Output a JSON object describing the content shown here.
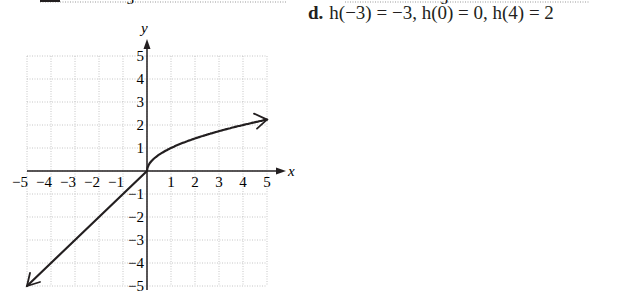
{
  "problem": {
    "letter": "d.",
    "answer_text": "h(−3) = −3, h(0) = 0, h(4) = 2"
  },
  "top_fragment": {
    "left_label": "−5",
    "right_label": "−5"
  },
  "chart_data": {
    "type": "line",
    "title": "",
    "xlabel": "x",
    "ylabel": "y",
    "xlim": [
      -5,
      5
    ],
    "ylim": [
      -5,
      5
    ],
    "grid": true,
    "x_ticks": [
      -5,
      -4,
      -3,
      -2,
      -1,
      1,
      2,
      3,
      4,
      5
    ],
    "y_ticks": [
      -5,
      -4,
      -3,
      -2,
      -1,
      1,
      2,
      3,
      4,
      5
    ],
    "x_tick_labels": [
      "−5",
      "−4",
      "−3",
      "−2",
      "−1",
      "1",
      "2",
      "3",
      "4",
      "5"
    ],
    "y_tick_labels": [
      "−5",
      "−4",
      "−3",
      "−2",
      "−1",
      "1",
      "2",
      "3",
      "4",
      "5"
    ],
    "series": [
      {
        "name": "h(x)",
        "description": "piecewise: h(x) = x for x < 0, h(x) = √x for x ≥ 0",
        "x": [
          -5,
          -4,
          -3,
          -2,
          -1,
          0,
          0.25,
          0.5,
          1,
          1.5,
          2,
          2.5,
          3,
          3.5,
          4,
          4.5,
          5
        ],
        "y": [
          -5,
          -4,
          -3,
          -2,
          -1,
          0,
          0.5,
          0.71,
          1,
          1.22,
          1.41,
          1.58,
          1.73,
          1.87,
          2,
          2.12,
          2.24
        ],
        "arrow_left": true,
        "arrow_right": true
      }
    ],
    "legend": null
  }
}
